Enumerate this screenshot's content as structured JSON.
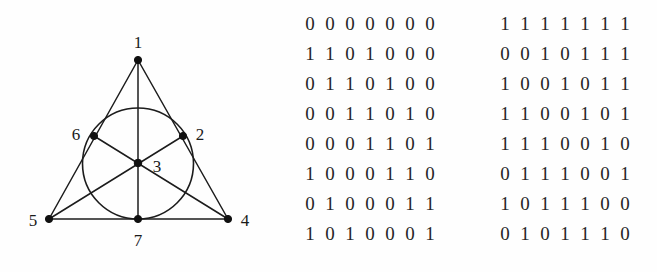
{
  "figure": {
    "caption": "",
    "type": "fano-plane-incidence-diagram",
    "background_color": "#fefefe",
    "ink_color": "#1a1a1a",
    "vertex_labels": [
      {
        "id": "1",
        "label": "1",
        "x": 138,
        "y": 60,
        "label_x": 138,
        "label_y": 48
      },
      {
        "id": "2",
        "label": "2",
        "x": 183,
        "y": 136,
        "label_x": 200,
        "label_y": 132
      },
      {
        "id": "3",
        "label": "3",
        "x": 138,
        "y": 163,
        "label_x": 157,
        "label_y": 172
      },
      {
        "id": "4",
        "label": "4",
        "x": 228,
        "y": 219,
        "label_x": 245,
        "label_y": 224
      },
      {
        "id": "5",
        "label": "5",
        "x": 49,
        "y": 219,
        "label_x": 33,
        "label_y": 224
      },
      {
        "id": "6",
        "label": "6",
        "x": 94,
        "y": 136,
        "label_x": 76,
        "label_y": 132
      },
      {
        "id": "7",
        "label": "7",
        "x": 138,
        "y": 219,
        "label_x": 138,
        "label_y": 244
      }
    ],
    "lines": [
      {
        "name": "line-1-6-5",
        "from": "1",
        "to": "5"
      },
      {
        "name": "line-1-2-4",
        "from": "1",
        "to": "4"
      },
      {
        "name": "line-5-7-4",
        "from": "5",
        "to": "4"
      },
      {
        "name": "line-1-3-7",
        "from": "1",
        "to": "7"
      },
      {
        "name": "line-5-3-2",
        "from": "5",
        "to": "2"
      },
      {
        "name": "line-4-3-6",
        "from": "4",
        "to": "6"
      }
    ],
    "circle": {
      "name": "line-6-2-7",
      "cx": 138,
      "cy": 163.5,
      "r": 55.5
    }
  },
  "matrices": {
    "left": {
      "name": "incidence-matrix-left",
      "rows": [
        [
          "0",
          "0",
          "0",
          "0",
          "0",
          "0",
          "0"
        ],
        [
          "1",
          "1",
          "0",
          "1",
          "0",
          "0",
          "0"
        ],
        [
          "0",
          "1",
          "1",
          "0",
          "1",
          "0",
          "0"
        ],
        [
          "0",
          "0",
          "1",
          "1",
          "0",
          "1",
          "0"
        ],
        [
          "0",
          "0",
          "0",
          "1",
          "1",
          "0",
          "1"
        ],
        [
          "1",
          "0",
          "0",
          "0",
          "1",
          "1",
          "0"
        ],
        [
          "0",
          "1",
          "0",
          "0",
          "0",
          "1",
          "1"
        ],
        [
          "1",
          "0",
          "1",
          "0",
          "0",
          "0",
          "1"
        ]
      ]
    },
    "right": {
      "name": "incidence-matrix-right",
      "rows": [
        [
          "1",
          "1",
          "1",
          "1",
          "1",
          "1",
          "1"
        ],
        [
          "0",
          "0",
          "1",
          "0",
          "1",
          "1",
          "1"
        ],
        [
          "1",
          "0",
          "0",
          "1",
          "0",
          "1",
          "1"
        ],
        [
          "1",
          "1",
          "0",
          "0",
          "1",
          "0",
          "1"
        ],
        [
          "1",
          "1",
          "1",
          "0",
          "0",
          "1",
          "0"
        ],
        [
          "0",
          "1",
          "1",
          "1",
          "0",
          "0",
          "1"
        ],
        [
          "1",
          "0",
          "1",
          "1",
          "1",
          "0",
          "0"
        ],
        [
          "0",
          "1",
          "0",
          "1",
          "1",
          "1",
          "0"
        ]
      ]
    }
  }
}
